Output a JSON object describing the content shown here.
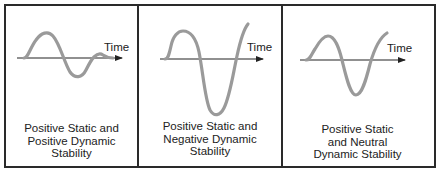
{
  "panels": [
    {
      "id": "positive-dynamic",
      "axis_label": "Time",
      "caption_lines": [
        "Positive Static and",
        "Positive Dynamic",
        "Stability"
      ],
      "description": "Damped oscillation converging to zero"
    },
    {
      "id": "negative-dynamic",
      "axis_label": "Time",
      "caption_lines": [
        "Positive Static and",
        "Negative Dynamic",
        "Stability"
      ],
      "description": "Divergent oscillation growing in amplitude"
    },
    {
      "id": "neutral-dynamic",
      "axis_label": "Time",
      "caption_lines": [
        "Positive Static",
        "and Neutral",
        "Dynamic Stability"
      ],
      "description": "Undamped oscillation with constant amplitude"
    }
  ],
  "colors": {
    "curve": "#9a9a9a",
    "axis": "#222222",
    "border": "#2a2a2a"
  }
}
